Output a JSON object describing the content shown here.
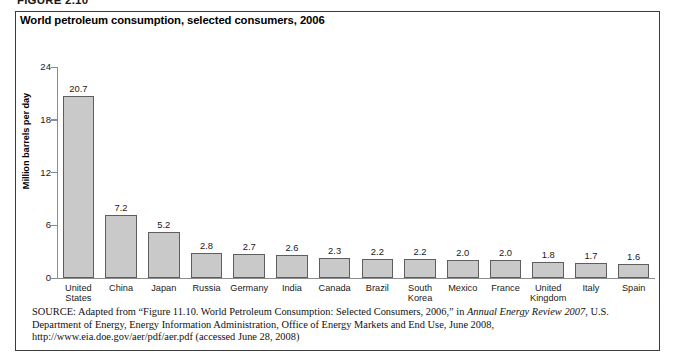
{
  "figure_label": "FIGURE 2.10",
  "figure": {
    "title": "World petroleum consumption, selected consumers, 2006"
  },
  "chart_data": {
    "type": "bar",
    "title": "World petroleum consumption, selected consumers, 2006",
    "xlabel": "",
    "ylabel": "Million barrels per day",
    "ylim": [
      0,
      24
    ],
    "yticks": [
      0,
      6,
      12,
      18,
      24
    ],
    "ytick_labels": [
      "0",
      "6",
      "12",
      "18",
      "24"
    ],
    "grid": false,
    "legend": "none",
    "bar_color": "#c9c9c9",
    "bar_edge_color": "#5e5e5e",
    "categories": [
      "United\nStates",
      "China",
      "Japan",
      "Russia",
      "Germany",
      "India",
      "Canada",
      "Brazil",
      "South\nKorea",
      "Mexico",
      "France",
      "United\nKingdom",
      "Italy",
      "Spain"
    ],
    "values": [
      20.7,
      7.2,
      5.2,
      2.8,
      2.7,
      2.6,
      2.3,
      2.2,
      2.2,
      2.0,
      2.0,
      1.8,
      1.7,
      1.6
    ],
    "value_labels": [
      "20.7",
      "7.2",
      "5.2",
      "2.8",
      "2.7",
      "2.6",
      "2.3",
      "2.2",
      "2.2",
      "2.0",
      "2.0",
      "1.8",
      "1.7",
      "1.6"
    ]
  },
  "source": {
    "prefix": "SOURCE:",
    "body_1": " Adapted from “Figure 11.10. World Petroleum Consumption: Selected Consumers, 2006,” in ",
    "italic_1": "Annual Energy Review 2007",
    "body_2": ", U.S. Department of Energy, Energy Information Administration, Office of Energy Markets and End Use, June 2008, http://www.eia.doe.gov/aer/pdf/aer.pdf (accessed June 28, 2008)"
  }
}
